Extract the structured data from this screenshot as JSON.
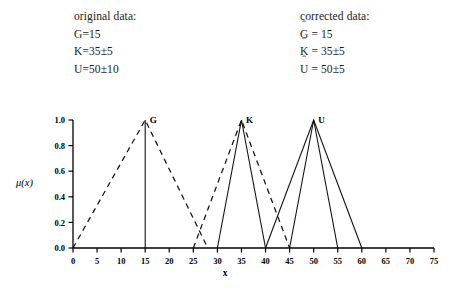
{
  "legend": {
    "original": {
      "heading": "original data:",
      "rows": [
        {
          "text": "G=15"
        },
        {
          "text": "K=35±5"
        },
        {
          "text": "U=50±10"
        }
      ]
    },
    "corrected": {
      "heading": "corrected data:",
      "rows": [
        {
          "symbol": "G",
          "hat": "ˆ",
          "text": " = 15"
        },
        {
          "symbol": "K",
          "hat": "ˆ",
          "text": " = 35±5"
        },
        {
          "symbol": "U",
          "hat": "ˆ",
          "text": " = 50±5"
        }
      ]
    }
  },
  "chart_data": {
    "type": "line",
    "title": "",
    "xlabel": "x",
    "ylabel": "μ(x)",
    "xlim": [
      0,
      75
    ],
    "ylim": [
      0.0,
      1.0
    ],
    "xticks": [
      0,
      5,
      10,
      15,
      20,
      25,
      30,
      35,
      40,
      45,
      50,
      55,
      60,
      65,
      70,
      75
    ],
    "xtick_labels": [
      "0",
      "5",
      "10",
      "15",
      "20",
      "25",
      "30",
      "35",
      "40",
      "45",
      "50",
      "55",
      "60",
      "65",
      "70",
      "75"
    ],
    "yticks": [
      0.0,
      0.2,
      0.4,
      0.6,
      0.8,
      1.0
    ],
    "ytick_labels": [
      "0.0",
      "0.2",
      "0.4",
      "0.6",
      "0.8",
      "1.0"
    ],
    "grid": false,
    "legend_position": "none",
    "annotations": [
      {
        "label": "G",
        "x": 15,
        "y": 1.0
      },
      {
        "label": "K",
        "x": 35,
        "y": 1.0
      },
      {
        "label": "U",
        "x": 50,
        "y": 1.0
      }
    ],
    "series": [
      {
        "name": "G original (dashed triangle)",
        "style": "dashed",
        "points": [
          [
            0,
            0.0
          ],
          [
            15,
            1.0
          ],
          [
            28,
            0.0
          ]
        ]
      },
      {
        "name": "G corrected (vertical singleton)",
        "style": "solid",
        "points": [
          [
            15,
            0.0
          ],
          [
            15,
            1.0
          ]
        ]
      },
      {
        "name": "K original (dashed triangle)",
        "style": "dashed",
        "points": [
          [
            25,
            0.0
          ],
          [
            35,
            1.0
          ],
          [
            45,
            0.0
          ]
        ]
      },
      {
        "name": "K corrected (solid triangle)",
        "style": "solid",
        "points": [
          [
            30,
            0.0
          ],
          [
            35,
            1.0
          ],
          [
            40,
            0.0
          ]
        ]
      },
      {
        "name": "U original (solid wide triangle)",
        "style": "solid",
        "points": [
          [
            40,
            0.0
          ],
          [
            50,
            1.0
          ],
          [
            60,
            0.0
          ]
        ]
      },
      {
        "name": "U corrected (solid narrow triangle)",
        "style": "solid",
        "points": [
          [
            45,
            0.0
          ],
          [
            50,
            1.0
          ],
          [
            55,
            0.0
          ]
        ]
      }
    ]
  }
}
